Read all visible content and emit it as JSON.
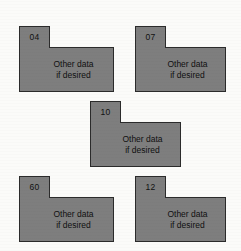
{
  "figure": {
    "background_color": "#fbfbf9",
    "shape_fill_color": "#7e7e7e",
    "shape_border_color": "#2b2b2b",
    "text_color": "#101010"
  },
  "blocks": [
    {
      "tag": "04",
      "body_line_1": "Other data",
      "body_line_2": "if desired",
      "position": {
        "left": 19,
        "top": 26
      },
      "tab": {
        "width": 31,
        "height": 21
      },
      "body": {
        "width": 95,
        "height": 45
      }
    },
    {
      "tag": "07",
      "body_line_1": "Other data",
      "body_line_2": "if desired",
      "position": {
        "left": 135,
        "top": 26
      },
      "tab": {
        "width": 31,
        "height": 21
      },
      "body": {
        "width": 91,
        "height": 45
      }
    },
    {
      "tag": "10",
      "body_line_1": "Other data",
      "body_line_2": "if desired",
      "position": {
        "left": 90,
        "top": 101
      },
      "tab": {
        "width": 31,
        "height": 21
      },
      "body": {
        "width": 91,
        "height": 45
      }
    },
    {
      "tag": "60",
      "body_line_1": "Other data",
      "body_line_2": "if desired",
      "position": {
        "left": 19,
        "top": 176
      },
      "tab": {
        "width": 31,
        "height": 21
      },
      "body": {
        "width": 95,
        "height": 45
      }
    },
    {
      "tag": "12",
      "body_line_1": "Other data",
      "body_line_2": "if desired",
      "position": {
        "left": 135,
        "top": 176
      },
      "tab": {
        "width": 31,
        "height": 21
      },
      "body": {
        "width": 91,
        "height": 45
      }
    }
  ]
}
